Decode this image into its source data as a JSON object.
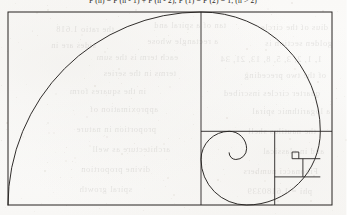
{
  "document": {
    "kind": "scanned-book-page",
    "formula_line": "F (n) = F (n - 1) + F (n - 2),  F (1) = F (2) = 1,  (n > 2)",
    "paper_color": "#fbfbfa",
    "ink_color": "#2b2724"
  },
  "bleed_through_text": [
    {
      "text": "dius of the circle",
      "x": 18,
      "y": 22
    },
    {
      "text": "tan of a spiral and",
      "x": 120,
      "y": 20
    },
    {
      "text": "the ratio 1.618",
      "x": 232,
      "y": 24
    },
    {
      "text": "golden section is",
      "x": 14,
      "y": 38
    },
    {
      "text": "a rectangle whose",
      "x": 128,
      "y": 36
    },
    {
      "text": "sides are in",
      "x": 250,
      "y": 40
    },
    {
      "text": "1, 1, 2, 3, 5, 8, 13, 21, 34",
      "x": 24,
      "y": 54
    },
    {
      "text": "each term is the sum",
      "x": 168,
      "y": 52
    },
    {
      "text": "of the two preceding",
      "x": 20,
      "y": 70
    },
    {
      "text": "terms in the series",
      "x": 170,
      "y": 68
    },
    {
      "text": "quarter circles inscribed",
      "x": 26,
      "y": 88
    },
    {
      "text": "in the squares form",
      "x": 200,
      "y": 86
    },
    {
      "text": "a logarithmic spiral",
      "x": 16,
      "y": 106
    },
    {
      "text": "approximation of",
      "x": 188,
      "y": 104
    },
    {
      "text": "the nautilus shell",
      "x": 30,
      "y": 126
    },
    {
      "text": "proportion in nature",
      "x": 190,
      "y": 124
    },
    {
      "text": "and in classical",
      "x": 22,
      "y": 146
    },
    {
      "text": "architecture as well",
      "x": 176,
      "y": 144
    },
    {
      "text": "Fibonacci numbers",
      "x": 28,
      "y": 166
    },
    {
      "text": "divine proportion",
      "x": 196,
      "y": 164
    },
    {
      "text": "phi = 1.6180339",
      "x": 34,
      "y": 186
    },
    {
      "text": "spiral growth",
      "x": 214,
      "y": 184
    }
  ],
  "figure": {
    "name": "fibonacci-golden-spiral",
    "type": "diagram",
    "stroke_color": "#262321",
    "stroke_width": 0.9,
    "fill": "none",
    "frame": {
      "x": 8,
      "y": 12,
      "width": 324,
      "height": 193
    },
    "squares": [
      {
        "label": "square-1",
        "x": 8,
        "y": 12,
        "size": 193
      },
      {
        "label": "square-2",
        "x": 201,
        "y": 12,
        "size": 119.3
      },
      {
        "label": "square-3",
        "x": 201,
        "y": 131.3,
        "size": 73.7
      },
      {
        "label": "square-4",
        "x": 274.7,
        "y": 131.3,
        "size": 45.6
      },
      {
        "label": "square-5",
        "x": 274.7,
        "y": 176.9,
        "size": 28.2
      },
      {
        "label": "square-6",
        "x": 302.9,
        "y": 158.7,
        "size": 17.4
      },
      {
        "label": "square-7",
        "x": 292.1,
        "y": 158.7,
        "size": 10.8
      },
      {
        "label": "square-8",
        "x": 292.1,
        "y": 152.0,
        "size": 6.7
      }
    ],
    "dividers": [
      {
        "label": "vertical-divider-main",
        "x1": 201,
        "y1": 12,
        "x2": 201,
        "y2": 205
      },
      {
        "label": "horizontal-divider-right",
        "x1": 201,
        "y1": 131.3,
        "x2": 332,
        "y2": 131.3
      },
      {
        "label": "vertical-divider-lower",
        "x1": 274.7,
        "y1": 131.3,
        "x2": 274.7,
        "y2": 205
      },
      {
        "label": "horizontal-divider-lower",
        "x1": 274.7,
        "y1": 176.9,
        "x2": 320.3,
        "y2": 176.9
      },
      {
        "label": "vertical-divider-tiny",
        "x1": 302.9,
        "y1": 158.7,
        "x2": 302.9,
        "y2": 176.9
      },
      {
        "label": "horizontal-divider-tiny",
        "x1": 292.1,
        "y1": 158.7,
        "x2": 320.3,
        "y2": 158.7
      }
    ],
    "spiral_path": "M 8 205 A 193 193 0 0 1 201 12 A 119.3 119.3 0 0 1 320.3 131.3 A 73.7 73.7 0 0 1 246.6 205 A 45.6 45.6 0 0 1 201 159.4 A 28.2 28.2 0 0 1 229.2 131.3 A 17.4 17.4 0 0 1 246.6 148.7 A 10.8 10.8 0 0 1 235.8 159.5 A 6.7 6.7 0 0 1 229.1 152.8",
    "caption": ""
  }
}
